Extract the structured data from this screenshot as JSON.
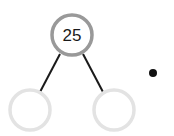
{
  "diagram": {
    "type": "factor-tree",
    "root": {
      "label": "25",
      "cx": 72,
      "cy": 35,
      "r": 20,
      "stroke": "#999999"
    },
    "children": [
      {
        "label": "",
        "cx": 30,
        "cy": 110,
        "r": 20,
        "stroke": "#e3e3e3"
      },
      {
        "label": "",
        "cx": 114,
        "cy": 110,
        "r": 20,
        "stroke": "#e3e3e3"
      }
    ],
    "edges": [
      {
        "x1": 60,
        "y1": 54,
        "x2": 40,
        "y2": 92
      },
      {
        "x1": 83,
        "y1": 54,
        "x2": 103,
        "y2": 92
      }
    ],
    "bullet": {
      "cx": 153,
      "cy": 73,
      "r": 4,
      "color": "#111111"
    }
  }
}
